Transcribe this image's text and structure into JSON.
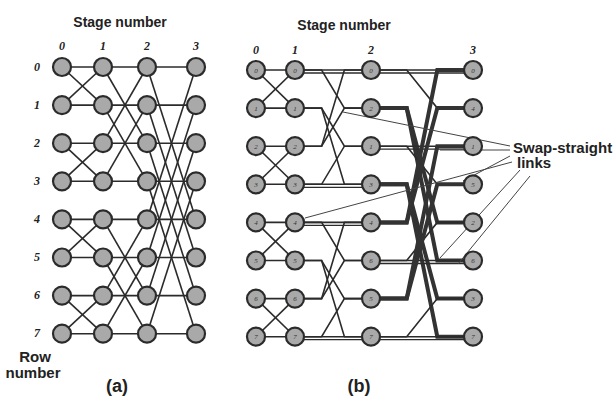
{
  "figure_a": {
    "title": "Stage number",
    "stage_labels": [
      "0",
      "1",
      "2",
      "3"
    ],
    "row_labels": [
      "0",
      "1",
      "2",
      "3",
      "4",
      "5",
      "6",
      "7"
    ],
    "row_axis_label_line1": "Row",
    "row_axis_label_line2": "number",
    "caption": "(a)",
    "stage_x": [
      62,
      103,
      147,
      196
    ],
    "row_y0": 67,
    "row_dy": 38.1,
    "butterfly_distances": [
      1,
      2,
      4
    ]
  },
  "figure_b": {
    "title": "Stage number",
    "stage_labels": [
      "0",
      "1",
      "2",
      "3"
    ],
    "caption": "(b)",
    "stage_x": [
      256,
      295,
      371,
      473
    ],
    "row_y0": 70,
    "row_dy": 38.1,
    "node_labels": [
      [
        "0",
        "1",
        "2",
        "3",
        "4",
        "5",
        "6",
        "7"
      ],
      [
        "0",
        "1",
        "2",
        "3",
        "4",
        "5",
        "6",
        "7"
      ],
      [
        "0",
        "2",
        "1",
        "3",
        "4",
        "6",
        "5",
        "7"
      ],
      [
        "0",
        "4",
        "1",
        "5",
        "2",
        "6",
        "3",
        "7"
      ]
    ],
    "annotation_line1": "Swap-straight",
    "annotation_line2": "links"
  },
  "colors": {
    "node_fill": "#a9a9a9",
    "stroke": "#2b2b2b",
    "background": "#ffffff"
  }
}
